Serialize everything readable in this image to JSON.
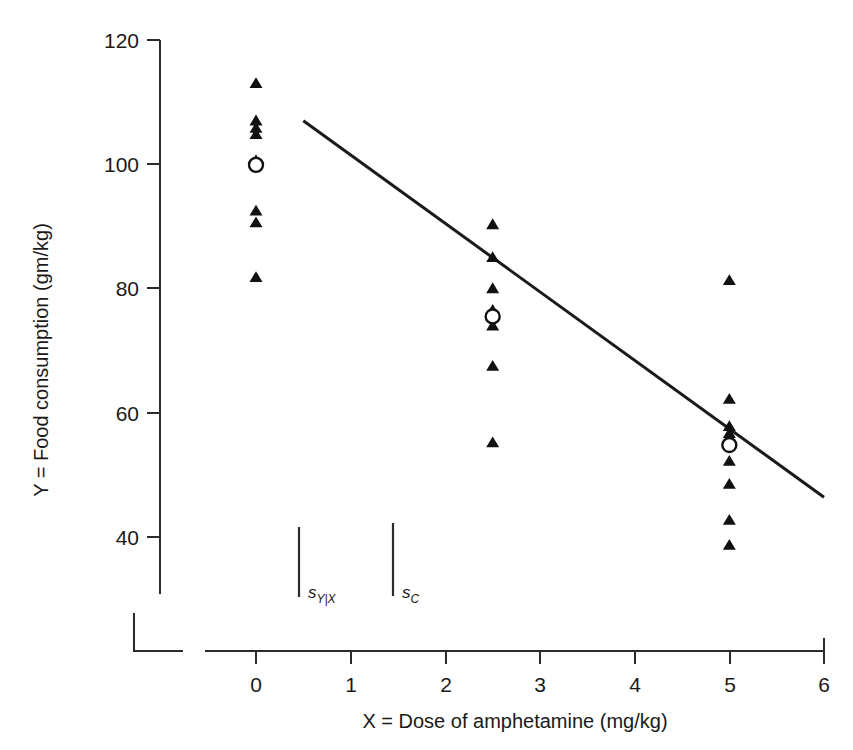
{
  "chart_data": {
    "type": "scatter",
    "title": "",
    "xlabel": "X = Dose of amphetamine (mg/kg)",
    "ylabel": "Y = Food consumption (gm/kg)",
    "xlim": [
      0,
      6
    ],
    "ylim": [
      33,
      120
    ],
    "xticks": [
      0,
      1,
      2,
      3,
      4,
      5,
      6
    ],
    "xtick_labels": [
      "0",
      "1",
      "2",
      "3",
      "4",
      "5",
      "6"
    ],
    "yticks": [
      40,
      60,
      80,
      100,
      120
    ],
    "ytick_labels": [
      "40",
      "60",
      "80",
      "100",
      "120"
    ],
    "grid": false,
    "legend": null,
    "groups": [
      {
        "x": 0,
        "label": "Dose 0 mg/kg",
        "values": [
          113.0,
          107.0,
          105.8,
          104.8,
          100.6,
          92.5,
          90.6,
          81.8
        ],
        "group_mean": 99.9
      },
      {
        "x": 2.5,
        "label": "Dose 2.5 mg/kg",
        "values": [
          90.3,
          85.0,
          80.0,
          76.5,
          74.0,
          67.5,
          55.2
        ],
        "group_mean": 75.5
      },
      {
        "x": 5,
        "label": "Dose 5 mg/kg",
        "values": [
          81.3,
          62.2,
          57.8,
          56.7,
          52.2,
          48.5,
          42.7,
          38.7
        ],
        "group_mean": 54.8
      }
    ],
    "regression_line": {
      "label": "least-squares regression line",
      "x_start": 0.5,
      "y_start": 107.0,
      "x_end": 6.0,
      "y_end": 46.4,
      "slope": -11.0,
      "intercept": 112.5
    },
    "annotations": [
      {
        "name": "s_Y_given_X",
        "label_main": "s",
        "label_sub": "Y|X",
        "x": 0.45,
        "y_top": 41.5,
        "y_bottom": 30.2
      },
      {
        "name": "s_C",
        "label_main": "s",
        "label_sub": "C",
        "x": 1.5,
        "y_top": 42.2,
        "y_bottom": 30.5
      }
    ],
    "marker_styles": {
      "observation": "filled-triangle",
      "group_mean": "open-circle"
    },
    "colors": {
      "marker": "#111111",
      "line": "#1a1a1a",
      "axis": "#2b2b2b",
      "background": "#ffffff",
      "text": "#1a1a1a"
    },
    "axis_break": true
  }
}
